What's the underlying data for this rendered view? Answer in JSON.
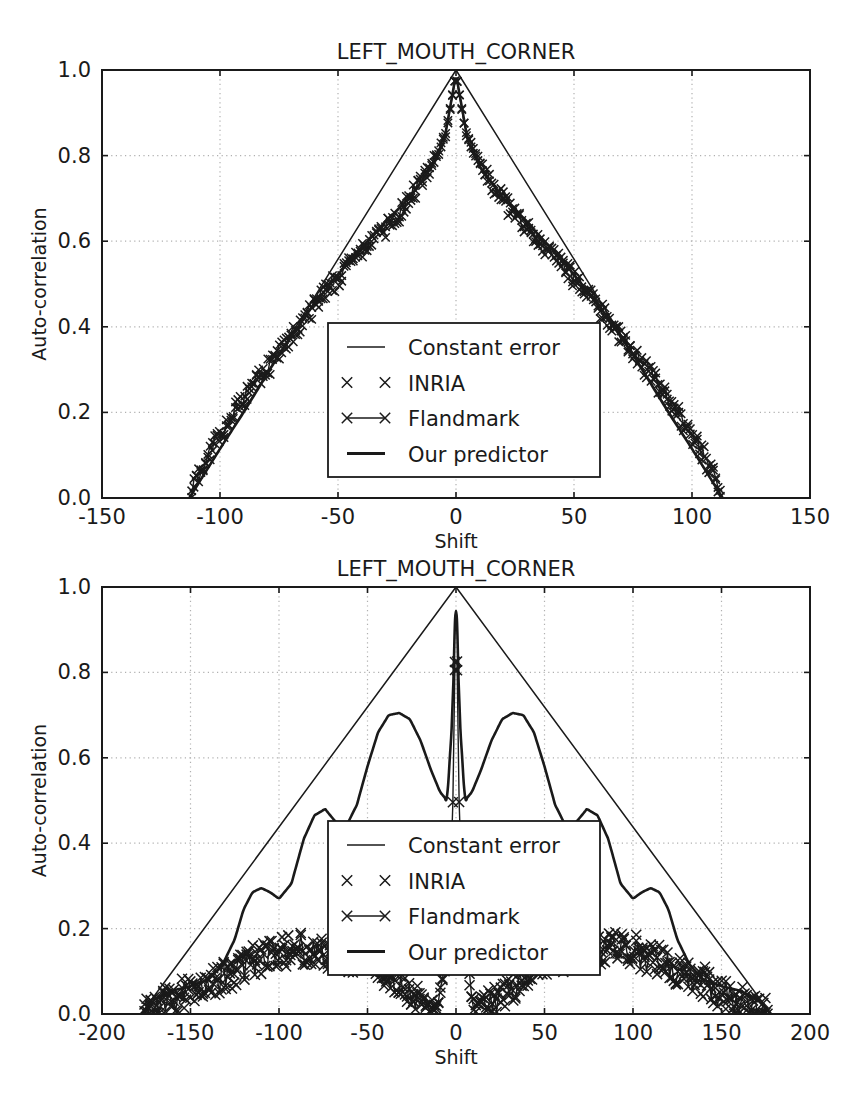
{
  "figure": {
    "background_color": "#ffffff",
    "foreground_color": "#1a1a1a",
    "grid_color": "#b0b0b0",
    "axis_color": "#1a1a1a"
  },
  "legend": {
    "entries": [
      {
        "label": "Constant error",
        "marker": "line-thin",
        "icon_name": "legend-line-thin-icon"
      },
      {
        "label": "INRIA",
        "marker": "x-markers",
        "icon_name": "legend-x-marker-icon"
      },
      {
        "label": "Flandmark",
        "marker": "x-line-x",
        "icon_name": "legend-x-line-icon"
      },
      {
        "label": "Our predictor",
        "marker": "line-thick",
        "icon_name": "legend-line-thick-icon"
      }
    ]
  },
  "chart_data": [
    {
      "id": "top",
      "type": "line",
      "title": "LEFT_MOUTH_CORNER",
      "xlabel": "Shift",
      "ylabel": "Auto-correlation",
      "xlim": [
        -150,
        150
      ],
      "ylim": [
        0.0,
        1.0
      ],
      "xticks": [
        -150,
        -100,
        -50,
        0,
        50,
        100,
        150
      ],
      "xticklabels": [
        "-150",
        "-100",
        "-50",
        "0",
        "50",
        "100",
        "150"
      ],
      "yticks": [
        0.0,
        0.2,
        0.4,
        0.6,
        0.8,
        1.0
      ],
      "yticklabels": [
        "0.0",
        "0.2",
        "0.4",
        "0.6",
        "0.8",
        "1.0"
      ],
      "grid": true,
      "legend_position": "center",
      "series": [
        {
          "name": "Constant error",
          "style": "line-thin",
          "x": [
            -113,
            -100,
            -75,
            -50,
            -25,
            0,
            25,
            50,
            75,
            100,
            113
          ],
          "values": [
            0.0,
            0.115,
            0.336,
            0.558,
            0.779,
            1.0,
            0.779,
            0.558,
            0.336,
            0.115,
            0.0
          ]
        },
        {
          "name": "INRIA",
          "style": "x-markers",
          "noise_amplitude": 0.022,
          "x": [
            -112,
            -105,
            -95,
            -85,
            -75,
            -65,
            -55,
            -45,
            -35,
            -25,
            -15,
            -8,
            -4,
            0,
            4,
            8,
            15,
            25,
            35,
            45,
            55,
            65,
            75,
            85,
            95,
            105,
            112
          ],
          "values": [
            0.02,
            0.1,
            0.19,
            0.27,
            0.335,
            0.41,
            0.48,
            0.545,
            0.6,
            0.655,
            0.735,
            0.8,
            0.855,
            0.99,
            0.855,
            0.8,
            0.735,
            0.655,
            0.6,
            0.545,
            0.48,
            0.41,
            0.335,
            0.27,
            0.19,
            0.1,
            0.02
          ]
        },
        {
          "name": "Flandmark",
          "style": "x-line-x",
          "noise_amplitude": 0.018,
          "x": [
            -112,
            -105,
            -95,
            -85,
            -75,
            -65,
            -55,
            -45,
            -35,
            -25,
            -15,
            -8,
            -4,
            0,
            4,
            8,
            15,
            25,
            35,
            45,
            55,
            65,
            75,
            85,
            95,
            105,
            112
          ],
          "values": [
            0.015,
            0.105,
            0.195,
            0.275,
            0.34,
            0.415,
            0.485,
            0.55,
            0.605,
            0.66,
            0.74,
            0.805,
            0.86,
            0.99,
            0.86,
            0.805,
            0.74,
            0.66,
            0.605,
            0.55,
            0.485,
            0.415,
            0.34,
            0.275,
            0.195,
            0.105,
            0.015
          ]
        },
        {
          "name": "Our predictor",
          "style": "line-thick",
          "x": [
            -113,
            -100,
            -90,
            -75,
            -60,
            -45,
            -30,
            -20,
            -10,
            -5,
            0,
            5,
            10,
            20,
            30,
            45,
            60,
            75,
            90,
            100,
            113
          ],
          "values": [
            0.0,
            0.115,
            0.2,
            0.335,
            0.455,
            0.555,
            0.645,
            0.7,
            0.775,
            0.835,
            0.99,
            0.835,
            0.775,
            0.7,
            0.645,
            0.555,
            0.455,
            0.335,
            0.2,
            0.115,
            0.0
          ]
        }
      ]
    },
    {
      "id": "bottom",
      "type": "line",
      "title": "LEFT_MOUTH_CORNER",
      "xlabel": "Shift",
      "ylabel": "Auto-correlation",
      "xlim": [
        -200,
        200
      ],
      "ylim": [
        0.0,
        1.0
      ],
      "xticks": [
        -200,
        -150,
        -100,
        -50,
        0,
        50,
        100,
        150,
        200
      ],
      "xticklabels": [
        "-200",
        "-150",
        "-100",
        "-50",
        "0",
        "50",
        "100",
        "150",
        "200"
      ],
      "yticks": [
        0.0,
        0.2,
        0.4,
        0.6,
        0.8,
        1.0
      ],
      "yticklabels": [
        "0.0",
        "0.2",
        "0.4",
        "0.6",
        "0.8",
        "1.0"
      ],
      "grid": true,
      "legend_position": "center",
      "series": [
        {
          "name": "Constant error",
          "style": "line-thin",
          "x": [
            -178,
            -150,
            -100,
            -50,
            0,
            50,
            100,
            150,
            178
          ],
          "values": [
            0.0,
            0.157,
            0.438,
            0.719,
            1.0,
            0.719,
            0.438,
            0.157,
            0.0
          ]
        },
        {
          "name": "Our predictor",
          "style": "line-thick",
          "x": [
            -178,
            -170,
            -160,
            -150,
            -140,
            -132,
            -125,
            -120,
            -115,
            -110,
            -105,
            -100,
            -93,
            -86,
            -80,
            -74,
            -68,
            -62,
            -56,
            -50,
            -44,
            -38,
            -32,
            -26,
            -20,
            -14,
            -9,
            -5,
            -2,
            0,
            2,
            5,
            9,
            14,
            20,
            26,
            32,
            38,
            44,
            50,
            56,
            62,
            68,
            74,
            80,
            86,
            93,
            100,
            105,
            110,
            115,
            120,
            125,
            132,
            140,
            150,
            160,
            170,
            178
          ],
          "values": [
            0.0,
            0.035,
            0.055,
            0.065,
            0.08,
            0.115,
            0.175,
            0.245,
            0.285,
            0.295,
            0.285,
            0.27,
            0.305,
            0.41,
            0.465,
            0.48,
            0.45,
            0.44,
            0.49,
            0.58,
            0.66,
            0.7,
            0.705,
            0.69,
            0.64,
            0.57,
            0.52,
            0.5,
            0.7,
            1.0,
            0.7,
            0.5,
            0.52,
            0.57,
            0.64,
            0.69,
            0.705,
            0.7,
            0.66,
            0.58,
            0.49,
            0.44,
            0.45,
            0.48,
            0.465,
            0.41,
            0.305,
            0.27,
            0.285,
            0.295,
            0.285,
            0.245,
            0.175,
            0.115,
            0.08,
            0.065,
            0.055,
            0.035,
            0.0
          ]
        },
        {
          "name": "INRIA",
          "style": "x-markers",
          "noise_amplitude": 0.04,
          "x": [
            -176,
            -168,
            -160,
            -152,
            -144,
            -136,
            -128,
            -120,
            -112,
            -104,
            -96,
            -88,
            -80,
            -72,
            -64,
            -56,
            -48,
            -40,
            -30,
            -20,
            -10,
            -5,
            -2,
            0,
            2,
            5,
            10,
            20,
            30,
            40,
            48,
            56,
            64,
            72,
            80,
            88,
            96,
            104,
            112,
            120,
            128,
            136,
            144,
            152,
            160,
            168,
            176
          ],
          "values": [
            0.01,
            0.02,
            0.035,
            0.05,
            0.065,
            0.08,
            0.095,
            0.115,
            0.13,
            0.145,
            0.15,
            0.155,
            0.15,
            0.145,
            0.14,
            0.135,
            0.125,
            0.1,
            0.06,
            0.03,
            0.02,
            0.14,
            0.36,
            0.99,
            0.36,
            0.14,
            0.02,
            0.03,
            0.06,
            0.1,
            0.125,
            0.135,
            0.14,
            0.145,
            0.15,
            0.155,
            0.15,
            0.145,
            0.13,
            0.115,
            0.095,
            0.08,
            0.065,
            0.05,
            0.035,
            0.02,
            0.01
          ]
        },
        {
          "name": "Flandmark",
          "style": "x-line-x",
          "noise_amplitude": 0.035,
          "x": [
            -176,
            -168,
            -160,
            -152,
            -144,
            -136,
            -128,
            -120,
            -112,
            -104,
            -96,
            -88,
            -80,
            -72,
            -64,
            -56,
            -48,
            -40,
            -30,
            -20,
            -10,
            -5,
            -2,
            0,
            2,
            5,
            10,
            20,
            30,
            40,
            48,
            56,
            64,
            72,
            80,
            88,
            96,
            104,
            112,
            120,
            128,
            136,
            144,
            152,
            160,
            168,
            176
          ],
          "values": [
            0.008,
            0.018,
            0.03,
            0.045,
            0.06,
            0.075,
            0.09,
            0.11,
            0.125,
            0.14,
            0.145,
            0.15,
            0.145,
            0.14,
            0.135,
            0.13,
            0.12,
            0.095,
            0.055,
            0.028,
            0.018,
            0.16,
            0.43,
            0.99,
            0.43,
            0.16,
            0.018,
            0.028,
            0.055,
            0.095,
            0.12,
            0.13,
            0.135,
            0.14,
            0.145,
            0.15,
            0.145,
            0.14,
            0.125,
            0.11,
            0.09,
            0.075,
            0.06,
            0.045,
            0.03,
            0.018,
            0.008
          ]
        }
      ]
    }
  ]
}
